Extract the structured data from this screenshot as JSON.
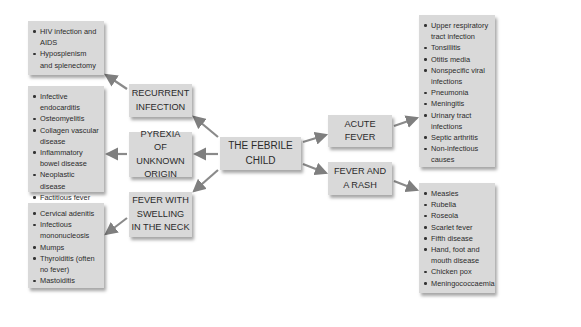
{
  "diagram": {
    "center": {
      "label": "THE FEBRILE\nCHILD"
    },
    "left_branches": [
      {
        "label": "RECURRENT\nINFECTION",
        "items": [
          "HIV infection and AIDS",
          "Hyposplenism and splenectomy"
        ]
      },
      {
        "label": "PYREXIA\nOF UNKNOWN\nORIGIN",
        "items": [
          "Infective endocarditis",
          "Osteomyelitis",
          "Collagen vascular disease",
          "Inflammatory bowel disease",
          "Neoplastic disease",
          "Factitious fever"
        ]
      },
      {
        "label": "FEVER WITH\nSWELLING\nIN THE NECK",
        "items": [
          "Cervical adenitis",
          "Infectious mononucleosis",
          "Mumps",
          "Thyroiditis (often no fever)",
          "Mastoiditis"
        ]
      }
    ],
    "right_branches": [
      {
        "label": "ACUTE\nFEVER",
        "items": [
          "Upper respiratory tract infection",
          "Tonsillitis",
          "Otitis media",
          "Nonspecific viral infections",
          "Pneumonia",
          "Meningitis",
          "Urinary tract infections",
          "Septic arthritis",
          "Non-infectious causes"
        ]
      },
      {
        "label": "FEVER AND\nA RASH",
        "items": [
          "Measles",
          "Rubella",
          "Roseola",
          "Scarlet fever",
          "Fifth disease",
          "Hand, foot and mouth disease",
          "Chicken pox",
          "Meningococcaemia"
        ]
      }
    ],
    "colors": {
      "box_fill": "#d9d9d9",
      "arrow": "#7f7f7f",
      "text": "#2b2b2b"
    }
  }
}
